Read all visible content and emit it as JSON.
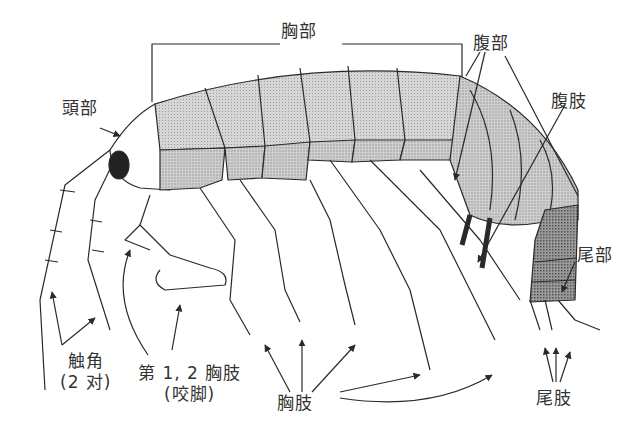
{
  "diagram": {
    "labels": {
      "thorax": "胸部",
      "head": "頭部",
      "abdomen": "腹部",
      "pleopods": "腹肢",
      "urosome": "尾部",
      "antennae": "触角",
      "antennae_note": "(2 对)",
      "gnathopods": "第 1, 2 胸肢",
      "gnathopods_note": "(咬脚)",
      "pereopods": "胸肢",
      "uropods": "尾肢"
    },
    "colors": {
      "ink": "#2a2a2a",
      "thorax_upper": "#c9c9c9",
      "thorax_lower": "#b4b4b4",
      "abdomen": "#c4c4c4",
      "urosome": "#8e8e8e",
      "eye": "#222222",
      "background": "#ffffff"
    }
  }
}
